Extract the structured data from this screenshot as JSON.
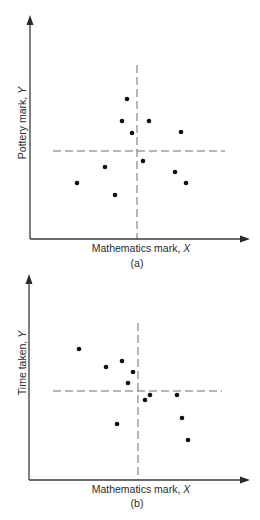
{
  "chart_data": [
    {
      "type": "scatter",
      "panel": "(a)",
      "xlabel": "Mathematics mark,",
      "xlabel_var": "X",
      "ylabel": "Pottery mark,",
      "ylabel_var": "Y",
      "caption": "(a)",
      "ticks": "none",
      "grid": false,
      "mean_crosshair": {
        "x_px": 137,
        "y_px": 151,
        "style": "dashed"
      },
      "axis_origin_px": {
        "x": 30,
        "y": 239
      },
      "points_px": [
        [
          127,
          99
        ],
        [
          122,
          121
        ],
        [
          149,
          121
        ],
        [
          132,
          133
        ],
        [
          181,
          132
        ],
        [
          143,
          161
        ],
        [
          105,
          167
        ],
        [
          175,
          172
        ],
        [
          77,
          183
        ],
        [
          186,
          183
        ],
        [
          115,
          195
        ]
      ],
      "relation": "no correlation"
    },
    {
      "type": "scatter",
      "panel": "(b)",
      "xlabel": "Mathematics mark,",
      "xlabel_var": "X",
      "ylabel": "Time taken,",
      "ylabel_var": "Y",
      "caption": "(b)",
      "ticks": "none",
      "grid": false,
      "mean_crosshair": {
        "x_px": 138,
        "y_px": 391,
        "style": "dashed"
      },
      "axis_origin_px": {
        "x": 29,
        "y": 480
      },
      "points_px": [
        [
          79,
          349
        ],
        [
          106,
          367
        ],
        [
          122,
          361
        ],
        [
          133,
          372
        ],
        [
          128,
          383
        ],
        [
          145,
          400
        ],
        [
          150,
          395
        ],
        [
          177,
          395
        ],
        [
          182,
          418
        ],
        [
          117,
          424
        ],
        [
          188,
          440
        ]
      ],
      "relation": "negative correlation"
    }
  ],
  "figure_a": {
    "xlabel": "Mathematics mark, ",
    "xlabel_var": "X",
    "ylabel": "Pottery mark, ",
    "ylabel_var": "Y",
    "caption": "(a)"
  },
  "figure_b": {
    "xlabel": "Mathematics mark, ",
    "xlabel_var": "X",
    "ylabel": "Time taken, ",
    "ylabel_var": "Y",
    "caption": "(b)"
  },
  "colors": {
    "axis": "#3a3a3a",
    "guide": "#6a6a6a",
    "dot": "#111111",
    "background": "#ffffff"
  }
}
